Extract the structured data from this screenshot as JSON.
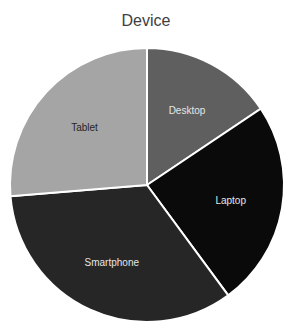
{
  "chart_data": {
    "type": "pie",
    "title": "Device",
    "categories": [
      "Desktop",
      "Laptop",
      "Smartphone",
      "Tablet"
    ],
    "values": [
      15.6,
      24.3,
      33.8,
      26.3
    ],
    "unit": "percent (estimated from slice angles)",
    "colors": [
      "#5f5f5f",
      "#0a0a0a",
      "#262626",
      "#a5a5a5"
    ],
    "label_colors": [
      "#e6e6e6",
      "#e6e6e6",
      "#e6e6e6",
      "#262626"
    ],
    "start_angle_deg": 0,
    "direction": "clockwise",
    "legend": "none (data labels inside slices)"
  }
}
